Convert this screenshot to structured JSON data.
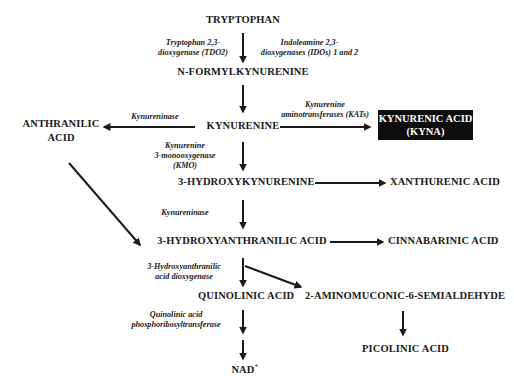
{
  "nodes": {
    "tryptophan": "TRYPTOPHAN",
    "n_formylkynurenine": "N-FORMYLKYNURENINE",
    "kynurenine": "KYNURENINE",
    "anthranilic_acid_1": "ANTHRANILIC",
    "anthranilic_acid_2": "ACID",
    "kynurenic_acid_1": "KYNURENIC ACID",
    "kynurenic_acid_2": "(KYNA)",
    "hydroxykynurenine": "3-HYDROXYKYNURENINE",
    "xanthurenic_acid": "XANTHURENIC ACID",
    "hydroxyanthranilic_acid": "3-HYDROXYANTHRANILIC ACID",
    "cinnabarinic_acid": "CINNABARINIC ACID",
    "quinolinic_acid": "QUINOLINIC ACID",
    "aminomuconic": "2-AMINOMUCONIC-6-SEMIALDEHYDE",
    "nad": "NAD",
    "nad_sup": "+",
    "picolinic_acid": "PICOLINIC ACID"
  },
  "enzymes": {
    "tdo2_1": "Tryptophan 2,3-",
    "tdo2_2": "dioxygenase (TDO2)",
    "ido_1": "Indoleamine 2,3-",
    "ido_2": "dioxygenases (IDOs) 1 and 2",
    "kynureninase_1": "Kynureninase",
    "kat_1": "Kynurenine",
    "kat_2": "aminotransferases (KATs)",
    "kmo_1": "Kynurenine",
    "kmo_2": "3-monooxygenase",
    "kmo_3": "(KMO)",
    "kynureninase_2": "Kynureninase",
    "haao_1": "3-Hydroxyanthranilic",
    "haao_2": "acid dioxygenase",
    "qprt_1": "Quinolinic acid",
    "qprt_2": "phosphoribosyltransferase"
  },
  "colors": {
    "ink": "#1a1a1a",
    "highlight_box": "#0d0d0d",
    "highlight_text": "#ffffff"
  }
}
